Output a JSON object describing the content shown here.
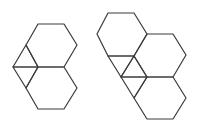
{
  "diagram": {
    "stroke_color": "#3a3a3a",
    "background": "#ffffff",
    "figures": [
      {
        "id": "left-figure",
        "hexagons": [
          "38,24 64,24 77,45 64,67 38,67 26,45",
          "38,67 64,67 77,88 64,109 38,109 26,88"
        ],
        "triangles": [
          "13,67 26,45 38,67",
          "13,67 38,67 26,88"
        ]
      },
      {
        "id": "right-figure",
        "hexagons": [
          "108,13 134,13 147,34 134,56 108,56 97,34",
          "147,34 173,34 186,55 173,77 147,77 134,56",
          "147,77 173,77 186,98 173,119 147,119 134,98"
        ],
        "triangles": [
          "108,56 134,56 121,77",
          "134,56 147,77 121,77",
          "121,77 147,77 134,98"
        ]
      }
    ]
  }
}
